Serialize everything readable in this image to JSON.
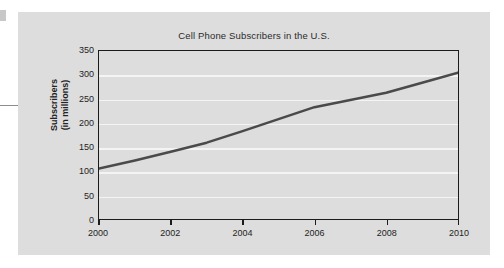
{
  "page": {
    "background_color": "#ffffff",
    "panel_color": "#dddddd"
  },
  "decorations": {
    "edge_glyph_name": "cropped-glyph-fragment",
    "left_rule_name": "left-margin-rule"
  },
  "chart_data": {
    "type": "line",
    "title": "Cell Phone Subscribers in the U.S.",
    "xlabel": "",
    "ylabel": "Subscribers\n(in millions)",
    "ylabel_line1": "Subscribers",
    "ylabel_line2": "(in millions)",
    "xlim": [
      2000,
      2010
    ],
    "ylim": [
      0,
      350
    ],
    "y_ticks": [
      0,
      50,
      100,
      150,
      200,
      250,
      300,
      350
    ],
    "y_tick_labels": [
      "0",
      "50",
      "100",
      "150",
      "200",
      "250",
      "300",
      "350"
    ],
    "x_ticks": [
      2000,
      2002,
      2004,
      2006,
      2008,
      2010
    ],
    "x_tick_labels": [
      "2000",
      "2002",
      "2004",
      "2006",
      "2008",
      "2010"
    ],
    "grid": "horizontal",
    "gridline_color": "#f4f4f4",
    "legend": "none",
    "line_color": "#4a4a4a",
    "line_width": 2.5,
    "series": [
      {
        "name": "Cell phone subscribers",
        "x": [
          2000,
          2001,
          2002,
          2003,
          2004,
          2005,
          2006,
          2007,
          2008,
          2009,
          2010
        ],
        "values": [
          105,
          122,
          140,
          159,
          183,
          208,
          233,
          248,
          263,
          284,
          305
        ]
      }
    ]
  }
}
